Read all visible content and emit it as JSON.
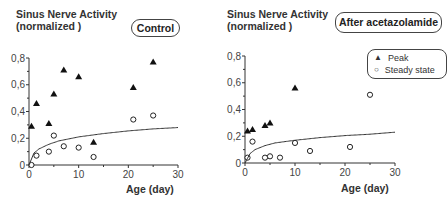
{
  "panels": [
    {
      "ylabel_line1": "Sinus Nerve Activity",
      "ylabel_line2": "(normalized )",
      "badge": "Control",
      "xlabel": "Age (day)",
      "xticks": [
        "0",
        "10",
        "20",
        "30"
      ],
      "yticks": [
        "0",
        "0,2",
        "0,4",
        "0,6",
        "0,8"
      ]
    },
    {
      "ylabel_line1": "Sinus Nerve Activity",
      "ylabel_line2": "(normalized )",
      "badge": "After acetazolamide",
      "xlabel": "Age (day)",
      "xticks": [
        "0",
        "10",
        "20",
        "30"
      ],
      "yticks": [
        "0",
        "0,2",
        "0,4",
        "0,6",
        "0,8"
      ],
      "legend": {
        "peak": "Peak",
        "steady": "Steady state"
      }
    }
  ],
  "chart_data": [
    {
      "type": "scatter",
      "title": "Control",
      "xlabel": "Age (day)",
      "ylabel": "Sinus Nerve Activity (normalized)",
      "xlim": [
        0,
        30
      ],
      "ylim": [
        0,
        0.8
      ],
      "series": [
        {
          "name": "Peak",
          "marker": "filled-triangle",
          "x": [
            0.5,
            1.5,
            4,
            5,
            7,
            10,
            13,
            21,
            25
          ],
          "y": [
            0.29,
            0.46,
            0.31,
            0.53,
            0.71,
            0.66,
            0.17,
            0.58,
            0.77
          ]
        },
        {
          "name": "Steady state",
          "marker": "open-circle",
          "x": [
            0.5,
            1.5,
            4,
            5,
            7,
            10,
            13,
            21,
            25
          ],
          "y": [
            0.0,
            0.07,
            0.1,
            0.22,
            0.14,
            0.13,
            0.06,
            0.34,
            0.37
          ]
        },
        {
          "name": "Fit",
          "marker": "line",
          "x": [
            0,
            1,
            2,
            4,
            6,
            10,
            15,
            20,
            25,
            30
          ],
          "y": [
            0,
            0.09,
            0.12,
            0.155,
            0.18,
            0.21,
            0.235,
            0.255,
            0.27,
            0.28
          ]
        }
      ]
    },
    {
      "type": "scatter",
      "title": "After acetazolamide",
      "xlabel": "Age (day)",
      "ylabel": "Sinus Nerve Activity (normalized)",
      "xlim": [
        0,
        30
      ],
      "ylim": [
        0,
        0.8
      ],
      "legend": [
        "Peak",
        "Steady state"
      ],
      "legend_position": "upper right",
      "series": [
        {
          "name": "Peak",
          "marker": "filled-triangle",
          "x": [
            0.5,
            1.5,
            4,
            5,
            10
          ],
          "y": [
            0.24,
            0.25,
            0.28,
            0.3,
            0.56
          ]
        },
        {
          "name": "Steady state",
          "marker": "open-circle",
          "x": [
            0.5,
            1.5,
            4,
            5,
            7,
            10,
            13,
            21,
            25
          ],
          "y": [
            0.04,
            0.16,
            0.04,
            0.05,
            0.04,
            0.15,
            0.09,
            0.12,
            0.51
          ]
        },
        {
          "name": "Fit",
          "marker": "line",
          "x": [
            0,
            1,
            2,
            4,
            6,
            10,
            15,
            20,
            25,
            30
          ],
          "y": [
            0,
            0.07,
            0.1,
            0.13,
            0.15,
            0.17,
            0.19,
            0.205,
            0.215,
            0.23
          ]
        }
      ]
    }
  ]
}
